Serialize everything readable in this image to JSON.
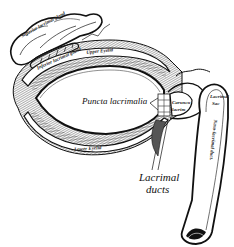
{
  "figure": {
    "style": "engraved anatomical illustration",
    "colors": {
      "ink": "#111111",
      "background": "#ffffff",
      "shade": "#555555"
    }
  },
  "labels": {
    "superior_lacrimal_gland": "Superior lacrimal gland",
    "inferior_lacrimal_gland": "Inferior lacrimal gland",
    "upper_eyelid": "Upper Eyelid",
    "puncta_lacrimalia": "Puncta lacrimalia",
    "caruncula_lacrimalis": "Caruncula lacrimalis",
    "caruncula_line1": "Caruncu",
    "caruncula_line2": "lacrim",
    "lacrimal_sac_line1": "Lacrimal",
    "lacrimal_sac_line2": "Sac",
    "lower_eyelid": "Lower Eyelid",
    "lacrimal_ducts_line1": "Lacrimal",
    "lacrimal_ducts_line2": "ducts",
    "nasolacrimal_duct": "Naso-lacrimal duct."
  }
}
